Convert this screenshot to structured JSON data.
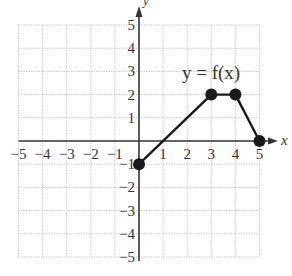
{
  "chart_data": {
    "type": "line",
    "title": "",
    "function_label": "y = f(x)",
    "xlabel": "x",
    "ylabel": "y",
    "xlim": [
      -5,
      5
    ],
    "ylim": [
      -5,
      5
    ],
    "grid": true,
    "x_ticks": [
      -5,
      -4,
      -3,
      -2,
      -1,
      1,
      2,
      3,
      4,
      5
    ],
    "y_ticks": [
      5,
      4,
      3,
      2,
      1,
      -1,
      -2,
      -3,
      -4,
      -5
    ],
    "x_tick_labels": [
      "−5",
      "−4",
      "−3",
      "−2",
      "−1",
      "1",
      "2",
      "3",
      "4",
      "5"
    ],
    "y_tick_labels": [
      "5",
      "4",
      "3",
      "2",
      "1",
      "−1",
      "−2",
      "−3",
      "−4",
      "−5"
    ],
    "series": [
      {
        "name": "f(x)",
        "points": [
          [
            0,
            -1
          ],
          [
            3,
            2
          ],
          [
            4,
            2
          ],
          [
            5,
            0
          ]
        ],
        "marker": "filled-circle",
        "color": "#1a1a1a"
      }
    ],
    "legend": "none"
  },
  "colors": {
    "axis": "#333333",
    "grid": "#c8c8c8",
    "curve": "#1a1a1a",
    "text": "#333333"
  }
}
